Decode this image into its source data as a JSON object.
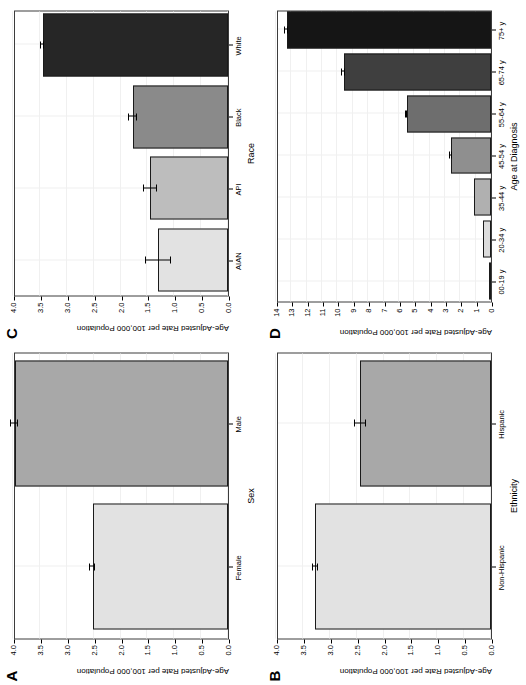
{
  "figure": {
    "panels": [
      "A",
      "B",
      "C",
      "D"
    ],
    "shared_ylabel": "Age-Adjusted Rate per 100,000 Population"
  },
  "chart_data": [
    {
      "id": "A",
      "panel_letter": "A",
      "type": "bar",
      "title": "",
      "xlabel": "Sex",
      "ylabel": "Age-Adjusted Rate per 100,000 Population",
      "categories": [
        "Female",
        "Male"
      ],
      "values": [
        2.52,
        3.97
      ],
      "errors_low": [
        2.47,
        3.91
      ],
      "errors_high": [
        2.57,
        4.03
      ],
      "bar_colors": [
        "#e2e2e2",
        "#a8a8a8"
      ],
      "ylim": [
        0.0,
        4.0
      ],
      "yticks": [
        0.0,
        0.5,
        1.0,
        1.5,
        2.0,
        2.5,
        3.0,
        3.5,
        4.0
      ],
      "ytick_labels": [
        "0.0",
        "0.5",
        "1.0",
        "1.5",
        "2.0",
        "2.5",
        "3.0",
        "3.5",
        "4.0"
      ],
      "grid": true,
      "legend": "none"
    },
    {
      "id": "B",
      "panel_letter": "B",
      "type": "bar",
      "title": "",
      "xlabel": "Ethnicity",
      "ylabel": "Age-Adjusted Rate per 100,000 Population",
      "categories": [
        "Non-Hispanic",
        "Hispanic"
      ],
      "values": [
        3.27,
        2.43
      ],
      "errors_low": [
        3.22,
        2.33
      ],
      "errors_high": [
        3.32,
        2.53
      ],
      "bar_colors": [
        "#e2e2e2",
        "#a8a8a8"
      ],
      "ylim": [
        0.0,
        4.0
      ],
      "yticks": [
        0.0,
        0.5,
        1.0,
        1.5,
        2.0,
        2.5,
        3.0,
        3.5,
        4.0
      ],
      "ytick_labels": [
        "0.0",
        "0.5",
        "1.0",
        "1.5",
        "2.0",
        "2.5",
        "3.0",
        "3.5",
        "4.0"
      ],
      "grid": true,
      "legend": "none"
    },
    {
      "id": "C",
      "panel_letter": "C",
      "type": "bar",
      "title": "",
      "xlabel": "Race",
      "ylabel": "Age-Adjusted Rate per 100,000 Population",
      "categories": [
        "AIAN",
        "API",
        "Black",
        "White"
      ],
      "values": [
        1.3,
        1.45,
        1.77,
        3.45
      ],
      "errors_low": [
        1.07,
        1.33,
        1.7,
        3.42
      ],
      "errors_high": [
        1.53,
        1.57,
        1.84,
        3.48
      ],
      "bar_colors": [
        "#e2e2e2",
        "#bdbdbd",
        "#8a8a8a",
        "#262626"
      ],
      "ylim": [
        0.0,
        4.0
      ],
      "yticks": [
        0.0,
        0.5,
        1.0,
        1.5,
        2.0,
        2.5,
        3.0,
        3.5,
        4.0
      ],
      "ytick_labels": [
        "0.0",
        "0.5",
        "1.0",
        "1.5",
        "2.0",
        "2.5",
        "3.0",
        "3.5",
        "4.0"
      ],
      "grid": true,
      "legend": "none"
    },
    {
      "id": "D",
      "panel_letter": "D",
      "type": "bar",
      "title": "",
      "xlabel": "Age at Diagnosis",
      "ylabel": "Age-Adjusted Rate per 100,000 Population",
      "categories": [
        "00-19 y",
        "20-34 y",
        "35-44 y",
        "45-54 y",
        "55-64 y",
        "65-74 y",
        "75+ y"
      ],
      "values": [
        0.05,
        0.5,
        1.1,
        2.6,
        5.5,
        9.6,
        13.3
      ],
      "errors_low": [
        0.05,
        0.5,
        1.1,
        2.55,
        5.45,
        9.5,
        13.2
      ],
      "errors_high": [
        0.05,
        0.5,
        1.1,
        2.65,
        5.55,
        9.7,
        13.4
      ],
      "bar_colors": [
        "#bdbdbd",
        "#dcdcdc",
        "#b0b0b0",
        "#8f8f8f",
        "#6e6e6e",
        "#3f3f3f",
        "#151515"
      ],
      "ylim": [
        0,
        14
      ],
      "yticks": [
        0,
        1,
        2,
        3,
        4,
        5,
        6,
        7,
        8,
        9,
        10,
        11,
        12,
        13,
        14
      ],
      "ytick_labels": [
        "0",
        "1",
        "2",
        "3",
        "4",
        "5",
        "6",
        "7",
        "8",
        "9",
        "10",
        "11",
        "12",
        "13",
        "14"
      ],
      "grid": true,
      "legend": "none"
    }
  ]
}
